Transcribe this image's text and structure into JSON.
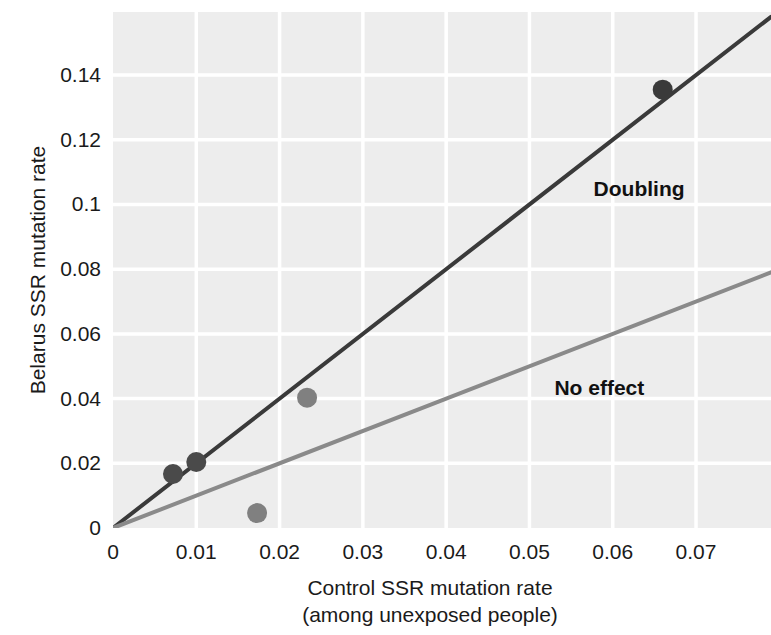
{
  "chart_data": {
    "type": "scatter",
    "title": "",
    "xlabel": "Control SSR mutation rate",
    "xlabel_sub": "(among unexposed people)",
    "ylabel": "Belarus SSR mutation rate",
    "xlim": [
      0,
      0.079
    ],
    "ylim": [
      0,
      0.1595
    ],
    "xticks": [
      "0",
      "0.01",
      "0.02",
      "0.03",
      "0.04",
      "0.05",
      "0.06",
      "0.07"
    ],
    "xtick_values": [
      0,
      0.01,
      0.02,
      0.03,
      0.04,
      0.05,
      0.06,
      0.07
    ],
    "yticks": [
      "0",
      "0.02",
      "0.04",
      "0.06",
      "0.08",
      "0.1",
      "0.12",
      "0.14"
    ],
    "ytick_values": [
      0,
      0.02,
      0.04,
      0.06,
      0.08,
      0.1,
      0.12,
      0.14
    ],
    "grid": true,
    "grid_color": "#ffffff",
    "plot_background": "#ededed",
    "legend_position": "inline-annotation",
    "points": [
      {
        "x": 0.0072,
        "y": 0.0167,
        "color": "#4a4a4a"
      },
      {
        "x": 0.01,
        "y": 0.0204,
        "color": "#4a4a4a"
      },
      {
        "x": 0.0173,
        "y": 0.0046,
        "color": "#808080"
      },
      {
        "x": 0.0233,
        "y": 0.0403,
        "color": "#808080"
      },
      {
        "x": 0.066,
        "y": 0.1355,
        "color": "#3a3a3a"
      }
    ],
    "lines": [
      {
        "name": "Doubling",
        "slope": 2,
        "intercept": 0,
        "color": "#3a3a3a",
        "width": 4
      },
      {
        "name": "No effect",
        "slope": 1,
        "intercept": 0,
        "color": "#8a8a8a",
        "width": 4
      }
    ],
    "annotations": [
      {
        "text": "Doubling",
        "x": 0.0577,
        "y": 0.1045
      },
      {
        "text": "No effect",
        "x": 0.053,
        "y": 0.043
      }
    ]
  }
}
